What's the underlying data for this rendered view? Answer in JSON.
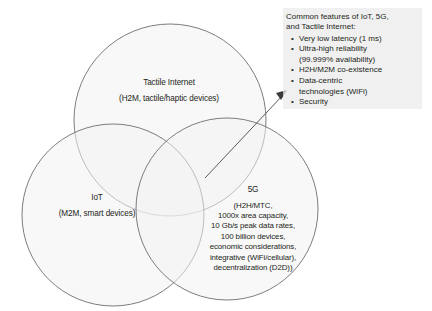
{
  "diagram": {
    "type": "venn-three-circle",
    "circles": [
      {
        "id": "tactile-internet",
        "title": "Tactile Internet",
        "subtitle": "(H2M, tactile/haptic devices)"
      },
      {
        "id": "iot",
        "title": "IoT",
        "subtitle": "(M2M, smart devices)"
      },
      {
        "id": "5g",
        "title": "5G",
        "detail_lines": [
          "(H2H/MTC,",
          "1000x area capacity,",
          "10 Gb/s peak data rates,",
          "100 billion devices,",
          "economic considerations,",
          "integrative (WiFi/cellular),",
          "decentralization (D2D))"
        ]
      }
    ],
    "callout": {
      "heading_lines": [
        "Common features of IoT, 5G,",
        "and Tactile Internet:"
      ],
      "bullets": [
        {
          "text": "Very low latency (1 ms)",
          "continuation": ""
        },
        {
          "text": "Ultra-high reliability",
          "continuation": "(99.999% availability)"
        },
        {
          "text": "H2H/M2M co-existence",
          "continuation": ""
        },
        {
          "text": "Data-centric",
          "continuation": "technologies (WiFi)"
        },
        {
          "text": "Security",
          "continuation": ""
        }
      ],
      "bullet_glyph": "•",
      "background_color": "#ebebeb"
    },
    "annotation": {
      "arrow_name": "intersection-to-callout-arrow",
      "stroke_color": "#5b5b5b"
    },
    "colors": {
      "circle_fill": "#f3f3f3",
      "circle_stroke": "#6e6e6e",
      "text": "#231f20",
      "page_background": "#ffffff"
    }
  }
}
